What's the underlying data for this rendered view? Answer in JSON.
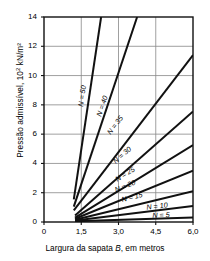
{
  "chart_data": {
    "type": "line",
    "title": "",
    "xlabel": "Largura da sapata B, em metros",
    "ylabel": "Pressão admissível, 10² kN/m²",
    "ylabel_main": "Pressão admissível, 10",
    "ylabel_exp": "2",
    "ylabel_unit": " kN/m²",
    "xlim": [
      0,
      6.0
    ],
    "ylim": [
      0,
      14
    ],
    "xticks": [
      0,
      1.5,
      3.0,
      4.5,
      6.0
    ],
    "xticklabels": [
      "0",
      "1,5",
      "3,0",
      "4,5",
      "6,0"
    ],
    "yticks": [
      0,
      2,
      4,
      6,
      8,
      10,
      12,
      14
    ],
    "yticklabels": [
      "0",
      "2",
      "4",
      "6",
      "8",
      "10",
      "12",
      "14"
    ],
    "grid": true,
    "legend_position": "inline-curve-labels",
    "line_color": "#111111",
    "grid_color": "#888888",
    "axis_color": "#111111",
    "series": [
      {
        "name": "N = 50",
        "label": "N = 50",
        "x": [
          1.2,
          2.3
        ],
        "y": [
          1.55,
          14.0
        ],
        "label_x": 1.55,
        "label_y": 8.6
      },
      {
        "name": "N = 40",
        "label": "N = 40",
        "x": [
          1.2,
          3.75
        ],
        "y": [
          1.05,
          14.0
        ],
        "label_x": 2.35,
        "label_y": 7.9
      },
      {
        "name": "N = 35",
        "label": "N = 35",
        "x": [
          1.2,
          6.0
        ],
        "y": [
          0.8,
          11.4
        ],
        "label_x": 2.85,
        "label_y": 6.6
      },
      {
        "name": "N = 30",
        "label": "N = 30",
        "x": [
          1.25,
          6.0
        ],
        "y": [
          0.45,
          7.55
        ],
        "label_x": 3.15,
        "label_y": 4.6
      },
      {
        "name": "N = 25",
        "label": "N = 25",
        "x": [
          1.25,
          6.0
        ],
        "y": [
          0.3,
          5.25
        ],
        "label_x": 3.25,
        "label_y": 3.3
      },
      {
        "name": "N = 20",
        "label": "N = 20",
        "x": [
          1.25,
          6.0
        ],
        "y": [
          0.22,
          3.5
        ],
        "label_x": 3.25,
        "label_y": 2.45
      },
      {
        "name": "N = 15",
        "label": "N = 15",
        "x": [
          1.25,
          6.0
        ],
        "y": [
          0.15,
          2.1
        ],
        "label_x": 3.55,
        "label_y": 1.7
      },
      {
        "name": "N = 10",
        "label": "N = 10",
        "x": [
          1.25,
          6.0
        ],
        "y": [
          0.1,
          1.1
        ],
        "label_x": 4.55,
        "label_y": 1.1
      },
      {
        "name": "N = 5",
        "label": "N = 5",
        "x": [
          1.25,
          6.0
        ],
        "y": [
          0.05,
          0.3
        ],
        "label_x": 4.7,
        "label_y": 0.45
      }
    ]
  }
}
